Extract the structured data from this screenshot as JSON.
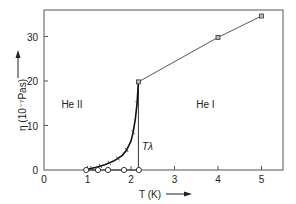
{
  "chart_data": {
    "type": "line",
    "title": "",
    "xlabel": "T (K)",
    "ylabel": "η (10⁻⁷Pas)",
    "xlim": [
      0,
      5.5
    ],
    "ylim": [
      0,
      36
    ],
    "xticks": [
      0,
      1,
      2,
      3,
      4,
      5
    ],
    "yticks": [
      0,
      10,
      20,
      30
    ],
    "grid": false,
    "series": [
      {
        "name": "He I (normal)",
        "marker": "square",
        "x": [
          2.17,
          4.0,
          5.0
        ],
        "y": [
          19.8,
          29.8,
          34.6
        ]
      },
      {
        "name": "He II (normal component)",
        "marker": "cross",
        "x": [
          0.95,
          1.1,
          1.2,
          1.3,
          1.4,
          1.5,
          1.6,
          1.7,
          1.8,
          1.9,
          2.0,
          2.05,
          2.1,
          2.14,
          2.17
        ],
        "y": [
          0.1,
          0.4,
          0.6,
          0.9,
          1.2,
          1.6,
          2.0,
          2.6,
          3.3,
          4.5,
          6.5,
          8.5,
          11.5,
          15.0,
          19.8
        ]
      },
      {
        "name": "He II (superfluid, flow method)",
        "marker": "open-circle",
        "x": [
          0.97,
          1.24,
          1.47,
          1.84,
          2.18
        ],
        "y": [
          0,
          0,
          0,
          0,
          0
        ]
      }
    ],
    "annotations": [
      {
        "text": "He II",
        "x": 0.4,
        "y": 14
      },
      {
        "text": "He I",
        "x": 3.5,
        "y": 14
      },
      {
        "text": "Tλ",
        "x": 2.25,
        "y": 4.5,
        "line_at_x": 2.17
      }
    ]
  }
}
